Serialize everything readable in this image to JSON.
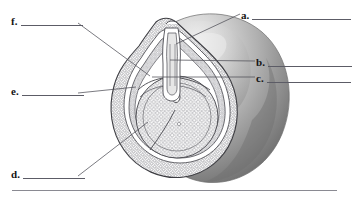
{
  "figure": {
    "kind": "labeling-exercise",
    "background_color": "#ffffff",
    "ink_color": "#141414",
    "rule_color": "#8a8a92"
  },
  "labels": [
    {
      "id": "a",
      "letter": "a.",
      "side": "right",
      "answer": "",
      "placeholder": ""
    },
    {
      "id": "b",
      "letter": "b.",
      "side": "right",
      "answer": "",
      "placeholder": ""
    },
    {
      "id": "c",
      "letter": "c.",
      "side": "right",
      "answer": "",
      "placeholder": ""
    },
    {
      "id": "d",
      "letter": "d.",
      "side": "left",
      "answer": "",
      "placeholder": ""
    },
    {
      "id": "e",
      "letter": "e.",
      "side": "left",
      "answer": "",
      "placeholder": ""
    },
    {
      "id": "f",
      "letter": "f.",
      "side": "left",
      "answer": "",
      "placeholder": ""
    }
  ],
  "illustration": {
    "name": "ovule-seed-cross-section",
    "description": "Half-sectioned rounded seed showing stippled cellular tissue layers, an inner spherical body, and a tapered apex with internal tube structures, set against a smoothly shaded three-dimensional outer body.",
    "icon": "seed-cross-section-icon",
    "outer_body_shading": {
      "highlight": "#f0f0f0",
      "midtone": "#b7b7b7",
      "shadow": "#6e6e6e"
    },
    "section_fill": "#fbfbfb",
    "cell_stipple_color": "#6f6f74",
    "outline_color": "#3a3a3f"
  },
  "divider": {
    "name": "bottom-rule",
    "visible": true
  }
}
